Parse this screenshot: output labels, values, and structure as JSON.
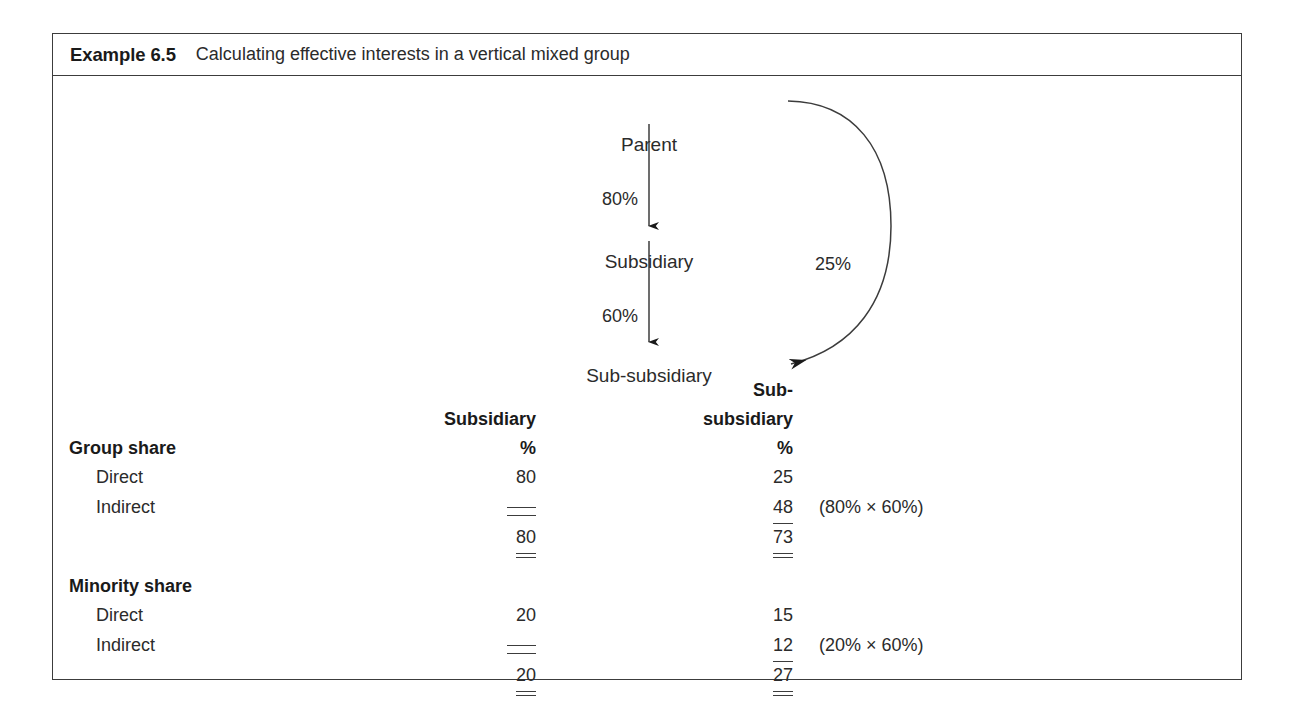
{
  "example": {
    "label": "Example 6.5",
    "title": "Calculating effective interests in a vertical mixed group"
  },
  "diagram": {
    "nodes": {
      "parent": "Parent",
      "subsidiary": "Subsidiary",
      "sub_subsidiary": "Sub-subsidiary"
    },
    "edges": {
      "parent_to_subsidiary": "80%",
      "subsidiary_to_sub_subsidiary": "60%",
      "parent_to_sub_subsidiary": "25%"
    },
    "line_color": "#2b2b2b"
  },
  "table": {
    "columns": [
      {
        "header": "Subsidiary",
        "unit": "%"
      },
      {
        "header_line1": "Sub-",
        "header_line2": "subsidiary",
        "unit": "%"
      }
    ],
    "sections": [
      {
        "title": "Group share",
        "rows": [
          {
            "label": "Direct",
            "subsidiary": "80",
            "sub_subsidiary": "25",
            "note": ""
          },
          {
            "label": "Indirect",
            "subsidiary": "",
            "sub_subsidiary": "48",
            "note": "(80% × 60%)"
          }
        ],
        "total": {
          "subsidiary": "80",
          "sub_subsidiary": "73"
        }
      },
      {
        "title": "Minority share",
        "rows": [
          {
            "label": "Direct",
            "subsidiary": "20",
            "sub_subsidiary": "15",
            "note": ""
          },
          {
            "label": "Indirect",
            "subsidiary": "",
            "sub_subsidiary": "12",
            "note": "(20% × 60%)"
          }
        ],
        "total": {
          "subsidiary": "20",
          "sub_subsidiary": "27"
        }
      }
    ]
  }
}
